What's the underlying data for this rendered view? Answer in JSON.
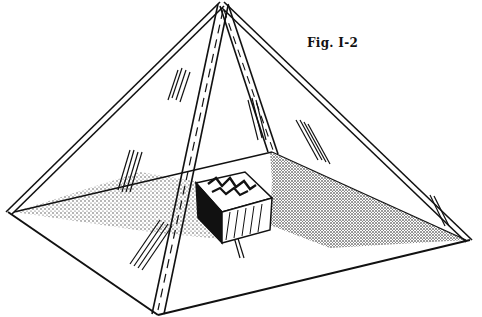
{
  "figure": {
    "caption": "Fig. I-2",
    "colors": {
      "ink": "#111111",
      "paper": "#ffffff"
    }
  }
}
